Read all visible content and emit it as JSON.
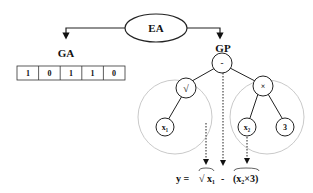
{
  "root": {
    "label": "EA"
  },
  "branches": {
    "left": {
      "label": "GA"
    },
    "right": {
      "label": "GP"
    }
  },
  "ga_chromosome": [
    "1",
    "0",
    "1",
    "1",
    "0"
  ],
  "gp_tree": {
    "root": "-",
    "left_subtree": {
      "op": "√",
      "child": "x₁"
    },
    "right_subtree": {
      "op": "×",
      "children": [
        "x₂",
        "3"
      ]
    }
  },
  "equation": {
    "lhs": "y =",
    "term1": "√ x₁",
    "operator": "-",
    "term2": "(x₂×3)"
  }
}
